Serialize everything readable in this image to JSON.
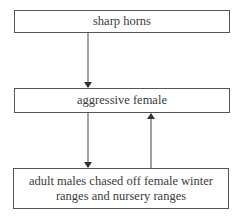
{
  "diagram": {
    "nodes": [
      {
        "id": "n1",
        "label": "sharp horns"
      },
      {
        "id": "n2",
        "label": "aggressive female"
      },
      {
        "id": "n3",
        "label": "adult males chased off female winter ranges and nursery ranges"
      }
    ],
    "edges": [
      {
        "from": "n1",
        "to": "n2",
        "direction": "down"
      },
      {
        "from": "n2",
        "to": "n3",
        "direction": "down"
      },
      {
        "from": "n3",
        "to": "n2",
        "direction": "up"
      }
    ],
    "colors": {
      "line": "#3a3a3a",
      "text": "#3a3a3a",
      "background": "#ffffff"
    }
  }
}
